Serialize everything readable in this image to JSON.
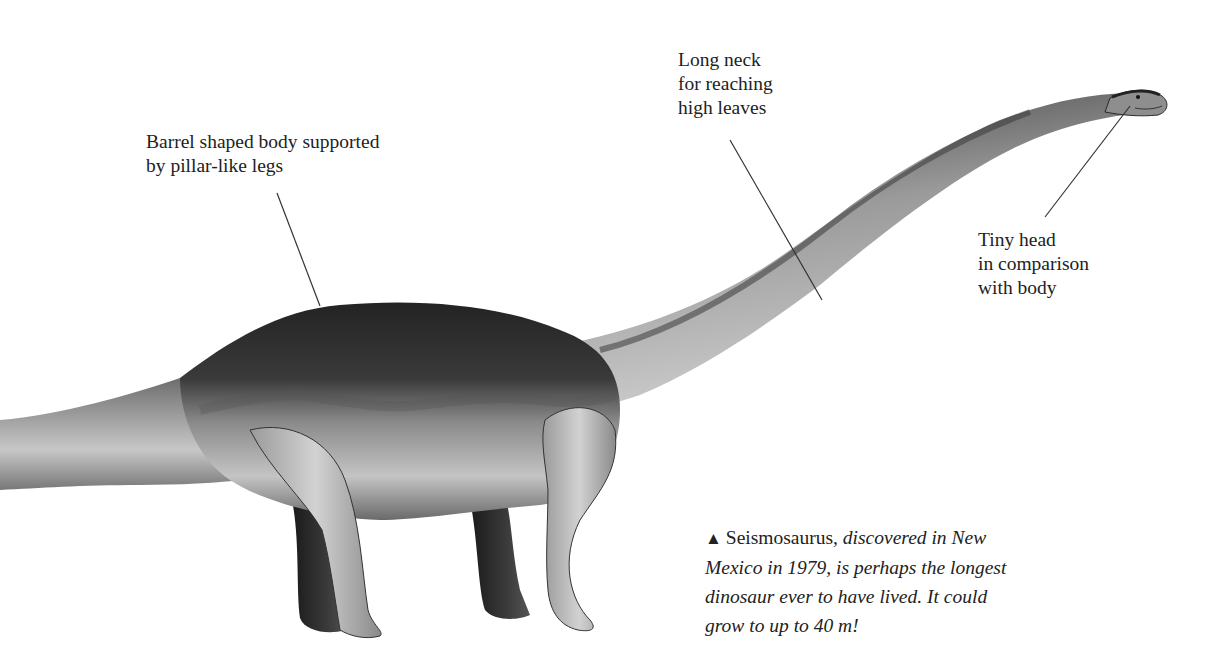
{
  "illustration": {
    "subject": "Seismosaurus side-view illustration",
    "colors": {
      "skin_dark": "#2b2b2b",
      "skin_mid": "#6e6e6e",
      "skin_light": "#c9c9c9",
      "leader_line": "#333333",
      "background": "#ffffff"
    }
  },
  "labels": {
    "body": {
      "lines": [
        "Barrel shaped body supported",
        "by pillar-like legs"
      ]
    },
    "neck": {
      "lines": [
        "Long neck",
        "for reaching",
        "high leaves"
      ]
    },
    "head": {
      "lines": [
        "Tiny head",
        "in comparison",
        "with body"
      ]
    }
  },
  "caption": {
    "marker": "▲",
    "name": "Seismosaurus,",
    "line1_italic": " discovered in New",
    "line2": "Mexico in 1979, is perhaps the longest",
    "line3": "dinosaur ever to have lived. It could",
    "line4": "grow to up to 40 m!"
  }
}
